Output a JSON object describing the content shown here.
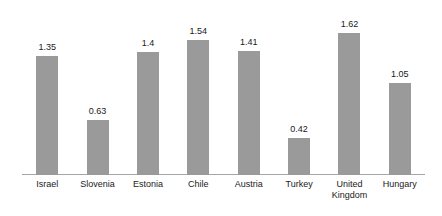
{
  "chart_data": {
    "type": "bar",
    "title": "",
    "subtitle": "",
    "xlabel": "",
    "ylabel": "",
    "categories": [
      "Israel",
      "Slovenia",
      "Estonia",
      "Chile",
      "Austria",
      "Turkey",
      "United\nKingdom",
      "Hungary"
    ],
    "values": [
      1.35,
      0.63,
      1.4,
      1.54,
      1.41,
      0.42,
      1.62,
      1.05
    ],
    "value_labels": [
      "1.35",
      "0.63",
      "1.4",
      "1.54",
      "1.41",
      "0.42",
      "1.62",
      "1.05"
    ],
    "ylim": [
      0,
      1.9
    ],
    "grid": false,
    "legend": null,
    "legend_position": "none",
    "bar_color": "#9a9a9a",
    "axis_color": "#a6a6a6",
    "text_color": "#1a1a1a",
    "annotations": []
  }
}
